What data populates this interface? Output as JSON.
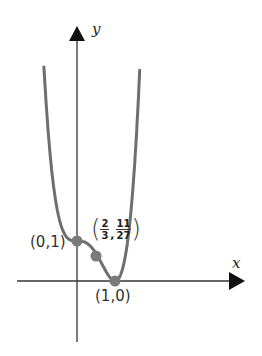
{
  "chart_data": {
    "type": "line",
    "title": "",
    "function": "f(x) = 3x^4 - 4x^3 + 1",
    "xlabel": "x",
    "ylabel": "y",
    "grid": false,
    "legend": null,
    "xlim": [
      -1.0,
      4.4
    ],
    "ylim": [
      -1.6,
      6.4
    ],
    "labeled_points": [
      {
        "label": "(0,1)",
        "x": 0,
        "y": 1
      },
      {
        "label_parts": {
          "x_num": "2",
          "x_den": "3",
          "y_num": "11",
          "y_den": "27"
        },
        "x": 0.6667,
        "y": 0.4074
      },
      {
        "label": "(1,0)",
        "x": 1,
        "y": 0
      }
    ],
    "curve_sample": {
      "x": [
        -1.05,
        -0.8,
        -0.6,
        -0.4,
        -0.2,
        0,
        0.2,
        0.4,
        0.6667,
        0.8,
        1.0,
        1.2,
        1.4,
        1.6,
        1.7,
        1.8
      ],
      "y": [
        4.36,
        4.28,
        2.25,
        1.33,
        1.04,
        1.0,
        0.97,
        0.82,
        0.41,
        0.18,
        0.0,
        0.31,
        1.54,
        4.28,
        6.41,
        8.18
      ]
    },
    "colors": {
      "curve": "#6e6e6e",
      "points": "#7a7a7a",
      "axes": "#222222"
    }
  },
  "labels": {
    "y_axis": "y",
    "x_axis": "x",
    "point_a": "(0,1)",
    "point_c": "(1,0)",
    "point_b_x_num": "2",
    "point_b_x_den": "3",
    "point_b_y_num": "11",
    "point_b_y_den": "27",
    "point_b_comma": ",",
    "paren_open": "(",
    "paren_close": ")"
  }
}
